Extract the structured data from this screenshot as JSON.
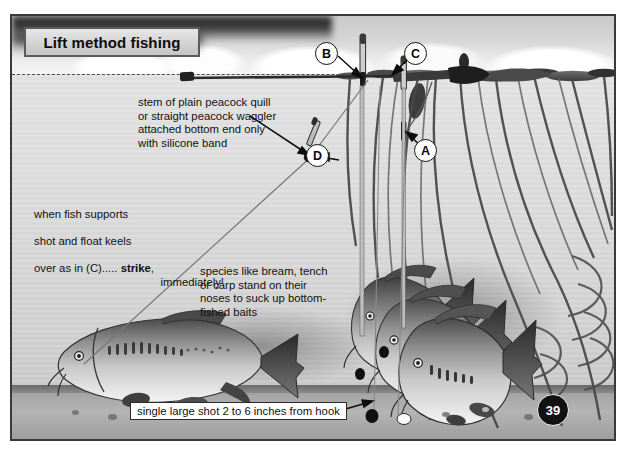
{
  "figure": {
    "title": "Lift method fishing",
    "page_number": "39"
  },
  "annotations": {
    "quill_note": "stem of plain peacock quill\nor straight peacock waggler\nattached bottom end only\nwith silicone band",
    "strike_note_line1": "when fish supports",
    "strike_note_line2": "shot and float keels",
    "strike_note_line3a": "over as in (C)..... ",
    "strike_note_line3b": "strike",
    "strike_note_line3c": ",",
    "strike_note_line4": "immediately!",
    "species_note": "species like bream, tench\nor carp stand on their\nnoses to suck up bottom-\nfished baits",
    "shot_label": "single large shot 2 to 6 inches from hook"
  },
  "markers": [
    {
      "id": "B",
      "label": "B"
    },
    {
      "id": "C",
      "label": "C"
    },
    {
      "id": "D",
      "label": "D"
    },
    {
      "id": "A",
      "label": "A"
    }
  ],
  "colors": {
    "ink": "#111111",
    "frame": "#3a3a3a",
    "water": "#d9d9d9",
    "bed": "#a6a6a6",
    "plate": "#ffffff"
  }
}
